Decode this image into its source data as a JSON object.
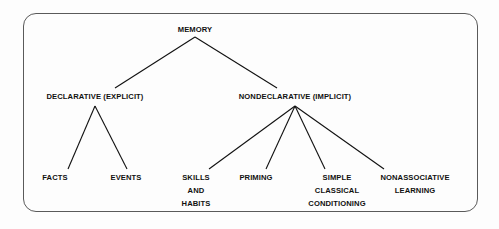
{
  "diagram": {
    "title": "MEMORY",
    "frame": {
      "shape": "rounded-rectangle",
      "border_color": "#5a5a5a",
      "background_color": "#fdfdfd"
    },
    "text_color": "#111111",
    "nodes": {
      "root": {
        "label": "MEMORY",
        "lines": [
          "MEMORY"
        ]
      },
      "declarative": {
        "label": "DECLARATIVE (EXPLICIT)",
        "lines": [
          "DECLARATIVE (EXPLICIT)"
        ]
      },
      "nondeclarative": {
        "label": "NONDECLARATIVE (IMPLICIT)",
        "lines": [
          "NONDECLARATIVE (IMPLICIT)"
        ]
      },
      "facts": {
        "label": "FACTS",
        "lines": [
          "FACTS"
        ]
      },
      "events": {
        "label": "EVENTS",
        "lines": [
          "EVENTS"
        ]
      },
      "skills_and_habits": {
        "label": "SKILLS AND HABITS",
        "lines": [
          "SKILLS",
          "AND",
          "HABITS"
        ]
      },
      "priming": {
        "label": "PRIMING",
        "lines": [
          "PRIMING"
        ]
      },
      "simple_classical_conditioning": {
        "label": "SIMPLE CLASSICAL CONDITIONING",
        "lines": [
          "SIMPLE",
          "CLASSICAL",
          "CONDITIONING"
        ]
      },
      "nonassociative_learning": {
        "label": "NONASSOCIATIVE LEARNING",
        "lines": [
          "NONASSOCIATIVE",
          "LEARNING"
        ]
      }
    },
    "edges": [
      {
        "from": "root",
        "to": "declarative"
      },
      {
        "from": "root",
        "to": "nondeclarative"
      },
      {
        "from": "declarative",
        "to": "facts"
      },
      {
        "from": "declarative",
        "to": "events"
      },
      {
        "from": "nondeclarative",
        "to": "skills_and_habits"
      },
      {
        "from": "nondeclarative",
        "to": "priming"
      },
      {
        "from": "nondeclarative",
        "to": "simple_classical_conditioning"
      },
      {
        "from": "nondeclarative",
        "to": "nonassociative_learning"
      }
    ]
  }
}
